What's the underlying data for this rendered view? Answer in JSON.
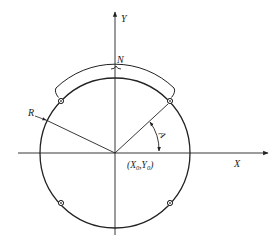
{
  "diagram": {
    "title": "",
    "labels": {
      "y_axis": "Y",
      "x_axis": "X",
      "arc_band": "N",
      "radius": "R",
      "angle": "A",
      "center": "(X0,Y0)"
    },
    "center_label_parts": {
      "open": "(X",
      "sub0": "0",
      "mid": ",Y",
      "sub1": "0",
      "close": ")"
    },
    "markers": [
      {
        "position": "upper-left",
        "angle_deg": 135
      },
      {
        "position": "upper-right",
        "angle_deg": 45
      },
      {
        "position": "lower-left",
        "angle_deg": 225
      },
      {
        "position": "lower-right",
        "angle_deg": 315
      }
    ],
    "colors": {
      "line": "#222222",
      "background": "#ffffff"
    }
  }
}
